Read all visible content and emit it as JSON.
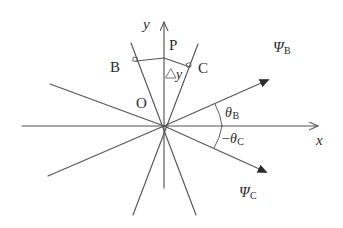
{
  "figure": {
    "type": "geometry-diagram",
    "background_color": "#ffffff",
    "line_color": "#555555",
    "text_color": "#2b2b2b"
  },
  "axes": {
    "x_label": "x",
    "y_label": "y",
    "origin_label": "O"
  },
  "lines": {
    "b_label": "B",
    "c_label": "C",
    "point_p_label": "P",
    "delta_y_label": "Δy",
    "delta_symbol": "△",
    "delta_variable": "y"
  },
  "rays": {
    "psi_b_symbol": "Ψ",
    "psi_b_sub": "B",
    "psi_c_symbol": "Ψ",
    "psi_c_sub": "C"
  },
  "angles": {
    "theta_b_symbol": "θ",
    "theta_b_sub": "B",
    "theta_c_prefix": "−",
    "theta_c_symbol": "θ",
    "theta_c_sub": "C"
  }
}
